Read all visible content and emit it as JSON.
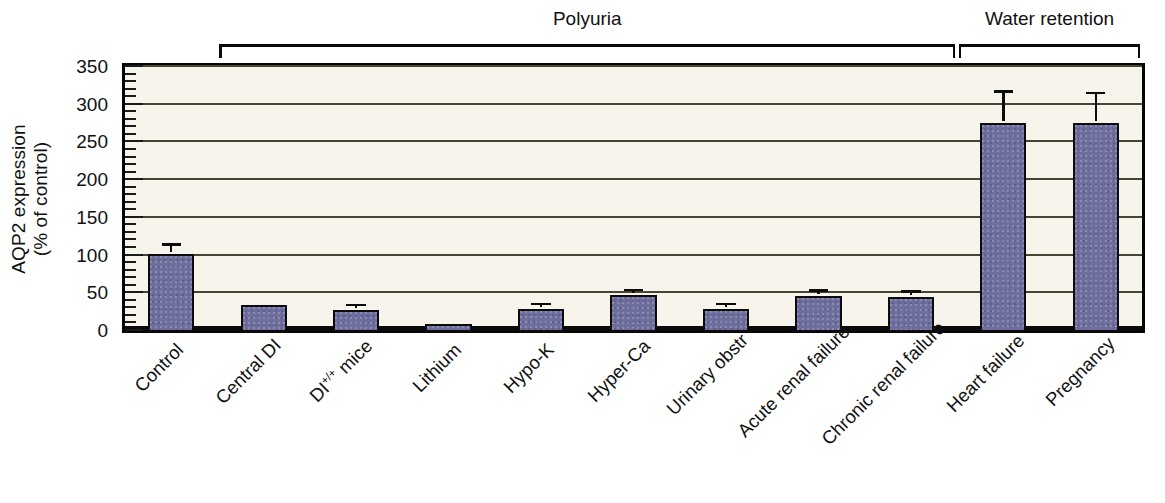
{
  "chart_data": {
    "type": "bar",
    "title": "",
    "xlabel": "",
    "ylabel": "AQP2 expression (% of control)",
    "ylabel_line1": "AQP2 expression",
    "ylabel_line2": "(% of control)",
    "ylim": [
      0,
      350
    ],
    "ytick_step": 50,
    "yminor_step": 10,
    "grid": true,
    "legend": "none",
    "categories": [
      "Control",
      "Central DI",
      "DI+/+ mice",
      "Lithium",
      "Hypo-K",
      "Hyper-Ca",
      "Urinary obstr",
      "Acute renal failure",
      "Chronic renal failure",
      "Heart failure",
      "Pregnancy"
    ],
    "category_labels_html": [
      {
        "text": "Control",
        "sup": ""
      },
      {
        "text": "Central DI",
        "sup": ""
      },
      {
        "text": "DI",
        "sup": "+/+",
        "tail": " mice"
      },
      {
        "text": "Lithium",
        "sup": ""
      },
      {
        "text": "Hypo-K",
        "sup": ""
      },
      {
        "text": "Hyper-Ca",
        "sup": ""
      },
      {
        "text": "Urinary obstr",
        "sup": ""
      },
      {
        "text": "Acute renal failure",
        "sup": ""
      },
      {
        "text": "Chronic renal failure",
        "sup": ""
      },
      {
        "text": "Heart failure",
        "sup": ""
      },
      {
        "text": "Pregnancy",
        "sup": ""
      }
    ],
    "values": [
      103,
      36,
      29,
      10,
      31,
      49,
      30,
      48,
      47,
      277,
      277
    ],
    "errors": [
      12,
      0,
      6,
      0,
      5,
      6,
      6,
      6,
      6,
      41,
      39
    ],
    "ytick_labels": [
      "0",
      "50",
      "100",
      "150",
      "200",
      "250",
      "300",
      "350"
    ],
    "ytick_values": [
      0,
      50,
      100,
      150,
      200,
      250,
      300,
      350
    ],
    "bar_color": "#6d6d9e",
    "bar_edge_color": "#0c0c0c",
    "plot_background": "#f7f4ec",
    "gridline_color": "#4a4232",
    "axis_color": "#050505"
  },
  "groups": [
    {
      "label": "Polyuria",
      "start_index": 1,
      "end_index": 8
    },
    {
      "label": "Water retention",
      "start_index": 9,
      "end_index": 10
    }
  ]
}
